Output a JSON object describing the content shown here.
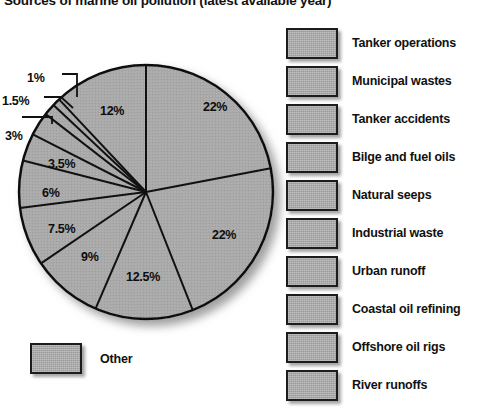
{
  "chart_data": {
    "type": "pie",
    "title": "Sources of marine oil pollution (latest available year)",
    "unit": "%",
    "start_angle_deg": 0,
    "direction": "clockwise",
    "categories": [
      "Tanker operations",
      "Municipal wastes",
      "Tanker accidents",
      "Bilge and fuel oils",
      "Natural seeps",
      "Industrial waste",
      "Urban runoff",
      "Coastal oil refining",
      "Offshore oil rigs",
      "River runoffs",
      "Other"
    ],
    "values": [
      22,
      22,
      12.5,
      9,
      7.5,
      6,
      3.5,
      3,
      1.5,
      1,
      12
    ],
    "slices": [
      {
        "label": "22%",
        "value": 22,
        "x": 203,
        "y": 100
      },
      {
        "label": "22%",
        "value": 22,
        "x": 212,
        "y": 228
      },
      {
        "label": "12.5%",
        "value": 12.5,
        "x": 126,
        "y": 270
      },
      {
        "label": "9%",
        "value": 9,
        "x": 81,
        "y": 250
      },
      {
        "label": "7.5%",
        "value": 7.5,
        "x": 48,
        "y": 222
      },
      {
        "label": "6%",
        "value": 6,
        "x": 42,
        "y": 186
      },
      {
        "label": "3.5%",
        "value": 3.5,
        "x": 48,
        "y": 157
      },
      {
        "label": "3%",
        "value": 3,
        "x": 5,
        "y": 129
      },
      {
        "label": "1.5%",
        "value": 1.5,
        "x": 2,
        "y": 94
      },
      {
        "label": "1%",
        "value": 1,
        "x": 27,
        "y": 71
      },
      {
        "label": "12%",
        "value": 12,
        "x": 100,
        "y": 104
      }
    ],
    "legend_position": "right",
    "colors": {
      "slice_fill": "#a9a9a9",
      "slice_border": "#111111",
      "text": "#111111"
    }
  },
  "legend": {
    "items": [
      {
        "label": "Tanker operations"
      },
      {
        "label": "Municipal wastes"
      },
      {
        "label": "Tanker accidents"
      },
      {
        "label": "Bilge and fuel oils"
      },
      {
        "label": "Natural seeps"
      },
      {
        "label": "Industrial waste"
      },
      {
        "label": "Urban runoff"
      },
      {
        "label": "Coastal oil refining"
      },
      {
        "label": "Offshore oil rigs"
      },
      {
        "label": "River runoffs"
      }
    ]
  },
  "other": {
    "label": "Other"
  }
}
